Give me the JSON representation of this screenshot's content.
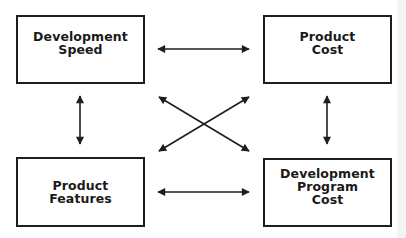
{
  "diagram": {
    "type": "relationship-diagram",
    "nodes": [
      {
        "id": "development-speed",
        "label": "Development\nSpeed"
      },
      {
        "id": "product-cost",
        "label": "Product\nCost"
      },
      {
        "id": "product-features",
        "label": "Product\nFeatures"
      },
      {
        "id": "development-program-cost",
        "label": "Development\nProgram\nCost"
      }
    ],
    "edges": [
      {
        "from": "development-speed",
        "to": "product-cost",
        "direction": "both"
      },
      {
        "from": "development-speed",
        "to": "product-features",
        "direction": "both"
      },
      {
        "from": "product-cost",
        "to": "development-program-cost",
        "direction": "both"
      },
      {
        "from": "product-features",
        "to": "development-program-cost",
        "direction": "both"
      },
      {
        "from": "development-speed",
        "to": "development-program-cost",
        "direction": "both"
      },
      {
        "from": "product-cost",
        "to": "product-features",
        "direction": "both"
      }
    ],
    "colors": {
      "line": "#1e1e1e",
      "background": "#ffffff"
    }
  }
}
